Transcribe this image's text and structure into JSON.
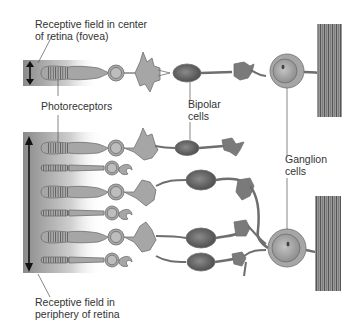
{
  "diagram": {
    "labels": {
      "fovea_field": [
        "Receptive field in center",
        "of retina (fovea)"
      ],
      "photoreceptors": "Photoreceptors",
      "bipolar": [
        "Bipolar",
        "cells"
      ],
      "ganglion": [
        "Ganglion",
        "cells"
      ],
      "periphery_field": [
        "Receptive field in",
        "periphery of retina"
      ]
    },
    "colors": {
      "cell_fill": "#a6a6a6",
      "cell_stroke": "#6e6e6e",
      "bipolar_fill": "#6f6f6f",
      "field_gradient_dark": "#8a8a8a",
      "nerve_fiber": "#7a7a7a",
      "text": "#333333"
    }
  }
}
